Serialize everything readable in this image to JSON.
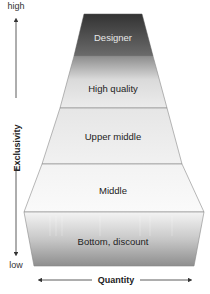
{
  "diagram": {
    "type": "market-segment-pyramid",
    "layers": [
      {
        "label": "Designer",
        "text_color": "#e8e8e8"
      },
      {
        "label": "High quality",
        "text_color": "#222222"
      },
      {
        "label": "Upper middle",
        "text_color": "#222222"
      },
      {
        "label": "Middle",
        "text_color": "#222222"
      },
      {
        "label": "Bottom, discount",
        "text_color": "#222222"
      }
    ],
    "y_axis": {
      "title": "Exclusivity",
      "high_label": "high",
      "low_label": "low"
    },
    "x_axis": {
      "title": "Quantity"
    },
    "colors": {
      "designer_top": "#3a3a3a",
      "designer_bottom": "#6a6a6a",
      "light_fill": "#f0f0f0",
      "bottom_dark": "#8a8a8a",
      "outline": "#777777",
      "axis": "#333333"
    }
  }
}
